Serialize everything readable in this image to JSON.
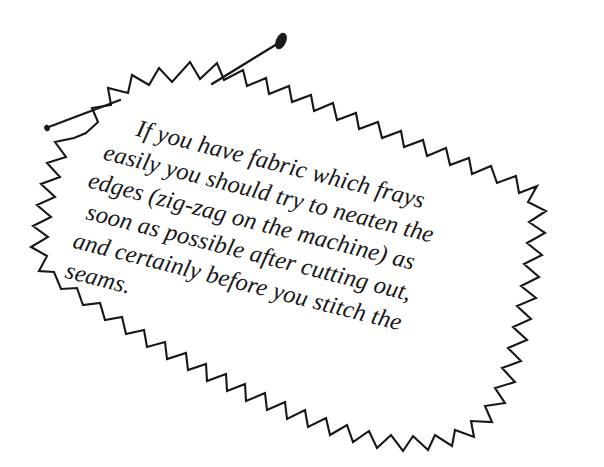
{
  "figure": {
    "type": "pinked-fabric-swatch-illustration",
    "background_color": "#ffffff",
    "ink_color": "#17171a"
  },
  "caption": {
    "full_text": "If you have fabric which frays easily you should try to neaten the edges (zig-zag on the machine) as soon as possible after cutting out, and certainly before you stitch the seams.",
    "rotation_degrees": 14.2,
    "lines": [
      "If you have fabric which frays",
      "easily you should try to neaten the",
      "edges (zig-zag on the machine) as",
      "soon as possible after cutting out,",
      "and certainly before you stitch the",
      "seams."
    ]
  },
  "swatch": {
    "name": "fabric-swatch",
    "edge_style": "pinked-zigzag",
    "outline_color": "#17171a",
    "outline_width": 2.1,
    "fill_color": "#ffffff"
  },
  "pins": [
    {
      "name": "pin-top",
      "head_color": "#1a1a1d",
      "shaft_color": "#17171a",
      "position_hint": "upper-center"
    },
    {
      "name": "pin-left",
      "head_color": "#1a1a1d",
      "shaft_color": "#17171a",
      "position_hint": "upper-left"
    }
  ]
}
